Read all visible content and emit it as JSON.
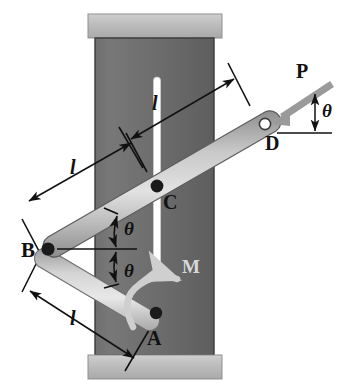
{
  "figure": {
    "background": "#ffffff"
  },
  "colors": {
    "column_body": "#6b6b6b",
    "column_cap": "#b9b9b9",
    "column_edge": "#3a3a3a",
    "slot": "#ffffff",
    "bar_light": "#d7d7d7",
    "bar_mid": "#a9a9a9",
    "bar_dark": "#8a8a8a",
    "bar_outline": "#4a4a4a",
    "pin_filled": "#1a1a1a",
    "pin_hollow": "#ffffff",
    "force_arrow": "#9a9a9a",
    "moment_arrow": "#cfcfcf",
    "annotation": "#111111"
  },
  "labels": {
    "point_a": "A",
    "point_b": "B",
    "point_c": "C",
    "point_d": "D",
    "force_p": "P",
    "moment_m": "M",
    "length_upper": "l",
    "length_middle": "l",
    "length_lower": "l",
    "angle_top": "θ",
    "angle_bottom": "θ",
    "angle_force": "θ"
  },
  "geometry": {
    "pin_a": {
      "x": 156,
      "y": 313,
      "type": "filled"
    },
    "pin_b": {
      "x": 48,
      "y": 249,
      "type": "filled"
    },
    "pin_c": {
      "x": 157,
      "y": 186,
      "type": "filled"
    },
    "pin_d": {
      "x": 265,
      "y": 124,
      "type": "hollow"
    },
    "bar_bd": {
      "from": "B",
      "to": "D",
      "label": "long bar through slot"
    },
    "bar_ba": {
      "from": "B",
      "to": "A",
      "label": "crank bar"
    },
    "slot": {
      "x": 157,
      "y_top": 77,
      "y_bottom": 266,
      "width": 7
    },
    "column": {
      "left": 95,
      "right": 214,
      "top": 38,
      "bottom": 355
    },
    "cap_top": {
      "left": 88,
      "right": 222,
      "top": 14,
      "bottom": 38
    },
    "cap_bottom": {
      "left": 88,
      "right": 222,
      "top": 355,
      "bottom": 379
    }
  },
  "annotations": {
    "dimension_upper": {
      "label": "l",
      "from": "C",
      "to": "D"
    },
    "dimension_middle": {
      "label": "l",
      "from": "B",
      "to": "C"
    },
    "dimension_lower": {
      "label": "l",
      "from": "B",
      "to": "A"
    },
    "angle_upper_note": "theta between bar BD and horizontal at B",
    "angle_lower_note": "theta between bar BA and horizontal at B",
    "force_note": "P applied at D, inclined theta below horizontal, pointing toward D",
    "moment_note": "M applied at A, counterclockwise curved arrow"
  }
}
